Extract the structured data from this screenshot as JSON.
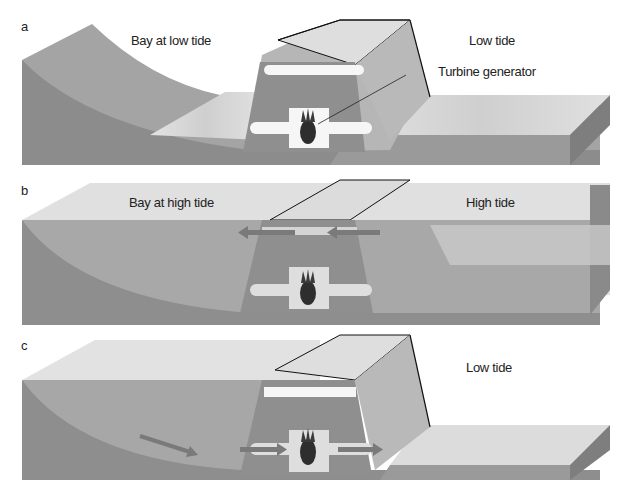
{
  "diagram": {
    "colors": {
      "background": "#ffffff",
      "ground_dark": "#8a8a8a",
      "ground_mid": "#a3a3a3",
      "water_light": "#d8d8d8",
      "concrete": "#9c9c9c",
      "concrete_top": "#dcdcdc",
      "pipe": "#f4f4f4",
      "arrow": "#7a7a7a",
      "outline": "#111111"
    },
    "panels": [
      {
        "letter": "a",
        "left_label": "Bay at low tide",
        "right_label": "Low tide",
        "callout": "Turbine generator"
      },
      {
        "letter": "b",
        "left_label": "Bay at high tide",
        "right_label": "High tide",
        "flow": "sea to bay (arrows pointing left through upper channel)"
      },
      {
        "letter": "c",
        "right_label": "Low tide",
        "flow": "bay to sea (arrows pointing right through turbine)"
      }
    ]
  }
}
